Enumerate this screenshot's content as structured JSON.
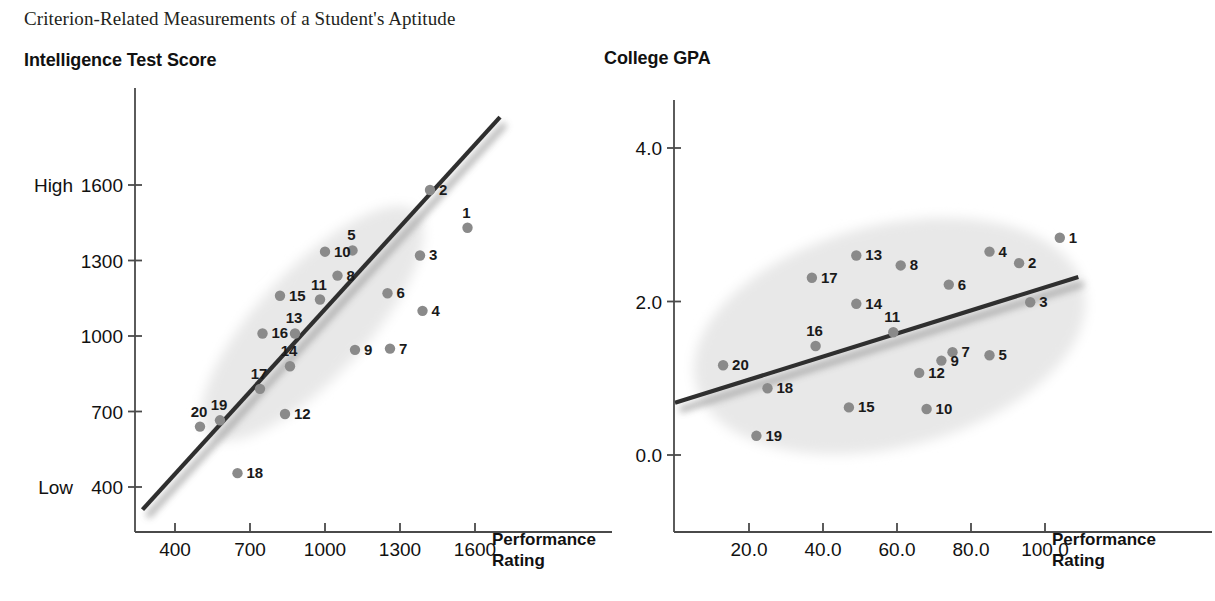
{
  "figure": {
    "title": "Criterion-Related Measurements of a Student's Aptitude"
  },
  "panels": {
    "left": {
      "title": "Intelligence Test Score",
      "y_low_label": "Low",
      "y_high_label": "High",
      "x_axis_title_line1": "Performance",
      "x_axis_title_line2": "Rating"
    },
    "right": {
      "title": "College GPA",
      "x_axis_title_line1": "Performance",
      "x_axis_title_line2": "Rating"
    }
  },
  "style": {
    "point_color": "#8a8a8a",
    "ellipse_color": "#e8e8e8",
    "line_color": "#2f2f2f",
    "axis_color": "#4a4a4a",
    "text_color": "#111111"
  },
  "chart_data": [
    {
      "type": "scatter",
      "title": "Intelligence Test Score",
      "xlabel": "Performance Rating",
      "ylabel": "Intelligence Test Score",
      "xlim": [
        250,
        1780
      ],
      "ylim": [
        280,
        1880
      ],
      "xticks": [
        400,
        700,
        1000,
        1300,
        1600
      ],
      "yticks": [
        400,
        700,
        1000,
        1300,
        1600
      ],
      "ytick_extra_labels": {
        "400": "Low",
        "1600": "High"
      },
      "grid": false,
      "legend": null,
      "trendline": {
        "x": [
          270,
          1700
        ],
        "y": [
          310,
          1870
        ]
      },
      "ellipse": {
        "cx": 950,
        "cy": 1050,
        "rx": 610,
        "ry": 215,
        "rotation_deg": -47
      },
      "points": [
        {
          "label": "1",
          "x": 1570,
          "y": 1430
        },
        {
          "label": "2",
          "x": 1420,
          "y": 1580
        },
        {
          "label": "3",
          "x": 1380,
          "y": 1320
        },
        {
          "label": "4",
          "x": 1390,
          "y": 1100
        },
        {
          "label": "5",
          "x": 1110,
          "y": 1340
        },
        {
          "label": "6",
          "x": 1250,
          "y": 1170
        },
        {
          "label": "7",
          "x": 1260,
          "y": 950
        },
        {
          "label": "8",
          "x": 1050,
          "y": 1240
        },
        {
          "label": "9",
          "x": 1120,
          "y": 945
        },
        {
          "label": "10",
          "x": 1000,
          "y": 1335
        },
        {
          "label": "11",
          "x": 980,
          "y": 1145
        },
        {
          "label": "12",
          "x": 840,
          "y": 690
        },
        {
          "label": "13",
          "x": 880,
          "y": 1010
        },
        {
          "label": "14",
          "x": 860,
          "y": 880
        },
        {
          "label": "15",
          "x": 820,
          "y": 1160
        },
        {
          "label": "16",
          "x": 750,
          "y": 1010
        },
        {
          "label": "17",
          "x": 740,
          "y": 790
        },
        {
          "label": "18",
          "x": 650,
          "y": 455
        },
        {
          "label": "19",
          "x": 580,
          "y": 665
        },
        {
          "label": "20",
          "x": 500,
          "y": 640
        }
      ]
    },
    {
      "type": "scatter",
      "title": "College GPA",
      "xlabel": "Performance Rating",
      "ylabel": "College GPA",
      "xlim": [
        0,
        128
      ],
      "ylim": [
        -0.45,
        4.75
      ],
      "xticks": [
        20,
        40,
        60,
        80,
        100
      ],
      "yticks": [
        0.0,
        2.0,
        4.0
      ],
      "ytick_label_format": "1 decimal",
      "grid": false,
      "legend": null,
      "trendline": {
        "x": [
          0,
          109
        ],
        "y": [
          0.68,
          2.32
        ]
      },
      "ellipse": {
        "cx": 58,
        "cy": 1.55,
        "rx": 54,
        "ry": 1.45,
        "rotation_deg": -14
      },
      "points": [
        {
          "label": "1",
          "x": 104,
          "y": 2.83
        },
        {
          "label": "2",
          "x": 93,
          "y": 2.5
        },
        {
          "label": "3",
          "x": 96,
          "y": 1.99
        },
        {
          "label": "4",
          "x": 85,
          "y": 2.65
        },
        {
          "label": "5",
          "x": 85,
          "y": 1.3
        },
        {
          "label": "6",
          "x": 74,
          "y": 2.22
        },
        {
          "label": "7",
          "x": 75,
          "y": 1.34
        },
        {
          "label": "8",
          "x": 61,
          "y": 2.47
        },
        {
          "label": "9",
          "x": 72,
          "y": 1.23
        },
        {
          "label": "10",
          "x": 68,
          "y": 0.6
        },
        {
          "label": "11",
          "x": 59,
          "y": 1.6
        },
        {
          "label": "12",
          "x": 66,
          "y": 1.07
        },
        {
          "label": "13",
          "x": 49,
          "y": 2.6
        },
        {
          "label": "14",
          "x": 49,
          "y": 1.97
        },
        {
          "label": "15",
          "x": 47,
          "y": 0.62
        },
        {
          "label": "16",
          "x": 38,
          "y": 1.42
        },
        {
          "label": "17",
          "x": 37,
          "y": 2.31
        },
        {
          "label": "18",
          "x": 25,
          "y": 0.87
        },
        {
          "label": "19",
          "x": 22,
          "y": 0.25
        },
        {
          "label": "20",
          "x": 13,
          "y": 1.17
        }
      ]
    }
  ]
}
